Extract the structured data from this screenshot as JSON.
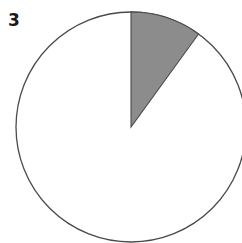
{
  "figure": {
    "label": "3"
  },
  "colors": {
    "slice_fill": "#8c8c8c",
    "remainder_fill": "#ffffff",
    "stroke": "#4a4a4a"
  },
  "chart_data": {
    "type": "pie",
    "title": "",
    "panel_label": "3",
    "categories": [
      "shaded",
      "unshaded"
    ],
    "values": [
      10,
      90
    ],
    "unit": "percent (estimated)",
    "start_angle_deg": 0,
    "direction": "clockwise",
    "legend": null
  }
}
